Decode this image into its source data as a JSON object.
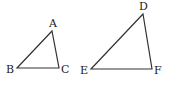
{
  "diagram": {
    "stroke_color": "#333333",
    "triangles": [
      {
        "name": "ABC",
        "vertices": [
          {
            "label": "A",
            "x": 52,
            "y": 31,
            "lx": 49,
            "ly": 27
          },
          {
            "label": "B",
            "x": 17,
            "y": 68,
            "lx": 6,
            "ly": 73
          },
          {
            "label": "C",
            "x": 59,
            "y": 68,
            "lx": 61,
            "ly": 73
          }
        ]
      },
      {
        "name": "DEF",
        "vertices": [
          {
            "label": "D",
            "x": 143,
            "y": 14,
            "lx": 139,
            "ly": 10
          },
          {
            "label": "E",
            "x": 91,
            "y": 69,
            "lx": 80,
            "ly": 74
          },
          {
            "label": "F",
            "x": 152,
            "y": 69,
            "lx": 154,
            "ly": 74
          }
        ]
      }
    ]
  }
}
